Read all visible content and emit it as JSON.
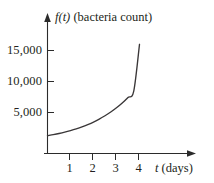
{
  "chart_data": {
    "type": "line",
    "title": "",
    "subtitle": "",
    "ylabel": "f(t) (bacteria count)",
    "ylabel_var": "f",
    "ylabel_arg": "(t)",
    "ylabel_rest": "(bacteria count)",
    "xlabel": "t (days)",
    "xlabel_var": "t",
    "xlabel_rest": "(days)",
    "grid": false,
    "legend": "none",
    "xlim": [
      0,
      4.6
    ],
    "ylim": [
      0,
      17500
    ],
    "xticks": [
      "1",
      "2",
      "3",
      "4"
    ],
    "xtick_values": [
      1,
      2,
      3,
      4
    ],
    "yticks": [
      "5,000",
      "10,000",
      "15,000"
    ],
    "ytick_values": [
      5000,
      10000,
      15000
    ],
    "series": [
      {
        "name": "f(t)",
        "color": "#3a3738",
        "x": [
          0,
          0.25,
          0.5,
          0.75,
          1,
          1.25,
          1.5,
          1.75,
          2,
          2.25,
          2.5,
          2.75,
          3,
          3.25,
          3.5,
          3.75,
          4
        ],
        "values": [
          1250,
          1420,
          1610,
          1830,
          2080,
          2360,
          2680,
          3050,
          3460,
          3930,
          4470,
          5070,
          5760,
          6540,
          7430,
          8440,
          16000
        ]
      }
    ],
    "annotations": []
  },
  "axes": {
    "y_axis_arrow": "up-arrow-icon",
    "x_axis_arrow": "right-arrow-icon"
  }
}
